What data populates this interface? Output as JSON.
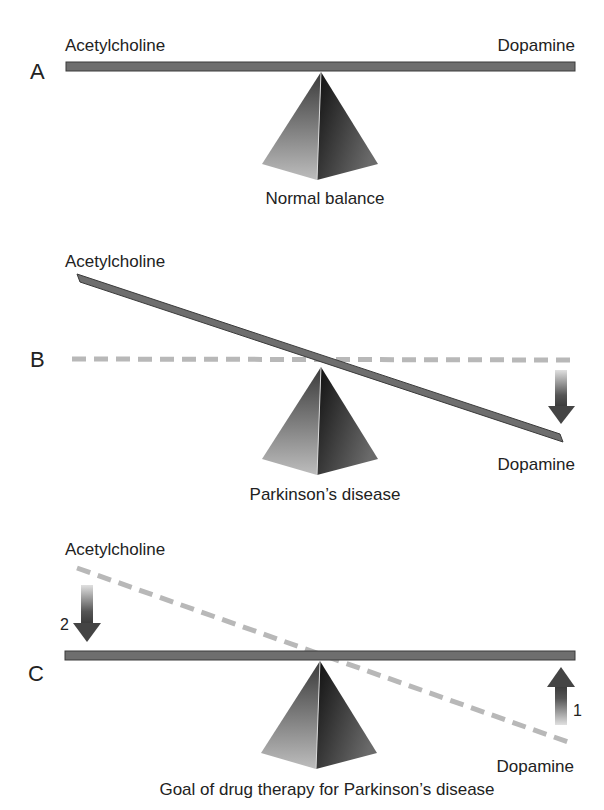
{
  "panels": [
    {
      "letter": "A",
      "left_label": "Acetylcholine",
      "right_label": "Dopamine",
      "caption": "Normal balance",
      "state": "balanced"
    },
    {
      "letter": "B",
      "left_label": "Acetylcholine",
      "right_label": "Dopamine",
      "caption": "Parkinson’s disease",
      "state": "tilted-dopamine-down"
    },
    {
      "letter": "C",
      "left_label": "Acetylcholine",
      "right_label": "Dopamine",
      "caption": "Goal of drug therapy for Parkinson’s disease",
      "state": "restored-balance",
      "arrows": [
        {
          "number": "2",
          "direction": "down",
          "side": "acetylcholine"
        },
        {
          "number": "1",
          "direction": "up",
          "side": "dopamine"
        }
      ]
    }
  ],
  "colors": {
    "beam": "#6e6e6e",
    "beam_border": "#3a3a3a",
    "dashed_line": "#b8b8b8",
    "pyramid_light": "#c8c8c8",
    "pyramid_dark": "#1e1e1e",
    "arrow": "#444444"
  }
}
